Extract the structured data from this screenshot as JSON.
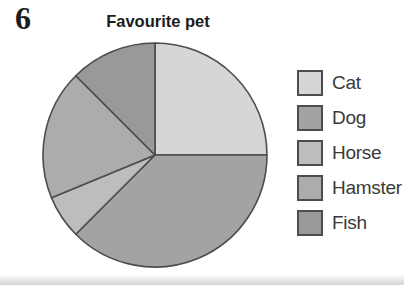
{
  "page": {
    "question_number": "6"
  },
  "chart_data": {
    "type": "pie",
    "title": "Favourite pet",
    "legend_position": "right",
    "start_angle_deg": 0,
    "direction": "clockwise",
    "outline_color": "#4d4d4d",
    "radius_px": 112,
    "categories": [
      "Cat",
      "Dog",
      "Horse",
      "Hamster",
      "Fish"
    ],
    "segments": [
      {
        "label": "Cat",
        "angle_deg": 90,
        "share_percent": 25,
        "color": "#d6d6d6"
      },
      {
        "label": "Dog",
        "angle_deg": 135,
        "share_percent": 37.5,
        "color": "#a3a3a3"
      },
      {
        "label": "Horse",
        "angle_deg": 22.5,
        "share_percent": 6.25,
        "color": "#bdbdbd"
      },
      {
        "label": "Hamster",
        "angle_deg": 67.5,
        "share_percent": 18.75,
        "color": "#acacac"
      },
      {
        "label": "Fish",
        "angle_deg": 45,
        "share_percent": 12.5,
        "color": "#999999"
      }
    ]
  }
}
